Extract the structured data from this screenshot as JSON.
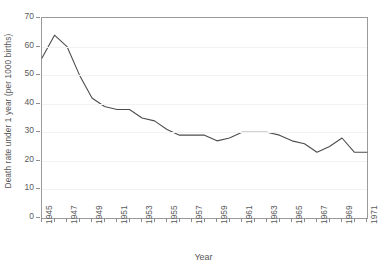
{
  "chart_data": {
    "type": "line",
    "title": "",
    "subtitle": "",
    "xlabel": "Year",
    "ylabel": "Death rate under 1 year (per 1000 births)",
    "xlim": [
      1945,
      1971
    ],
    "ylim": [
      0,
      70
    ],
    "ytick_step": 10,
    "yticks": [
      0,
      10,
      20,
      30,
      40,
      50,
      60,
      70
    ],
    "ytick_labels": [
      "0",
      "10",
      "20",
      "30",
      "40",
      "50",
      "60",
      "70"
    ],
    "xticks": [
      1945,
      1946,
      1947,
      1948,
      1949,
      1950,
      1951,
      1952,
      1953,
      1954,
      1955,
      1956,
      1957,
      1958,
      1959,
      1960,
      1961,
      1962,
      1963,
      1964,
      1965,
      1966,
      1967,
      1968,
      1969,
      1970,
      1971
    ],
    "xtick_labels_shown": [
      "1945",
      "1947",
      "1949",
      "1951",
      "1953",
      "1955",
      "1957",
      "1959",
      "1961",
      "1963",
      "1965",
      "1967",
      "1969",
      "1971"
    ],
    "xtick_label_rotation": -90,
    "grid": "horizontal",
    "legend": "none",
    "line_color": "#4d4d4d",
    "axis_color": "#9a9a9a",
    "grid_color": "#f2f2f2",
    "series": [
      {
        "name": "Death rate under 1 year (per 1000 births)",
        "x": [
          1945,
          1946,
          1947,
          1948,
          1949,
          1950,
          1951,
          1952,
          1953,
          1954,
          1955,
          1956,
          1957,
          1958,
          1959,
          1960,
          1961,
          1962,
          1963,
          1964,
          1965,
          1966,
          1967,
          1968,
          1969,
          1970,
          1971
        ],
        "values": [
          56,
          64,
          60,
          50,
          42,
          39,
          38,
          38,
          35,
          34,
          31,
          29,
          29,
          29,
          27,
          28,
          30,
          30,
          30,
          29,
          27,
          26,
          23,
          25,
          28,
          23,
          23
        ]
      }
    ]
  },
  "axes": {
    "y_title": "Death rate under 1 year (per 1000 births)",
    "x_title": "Year"
  }
}
